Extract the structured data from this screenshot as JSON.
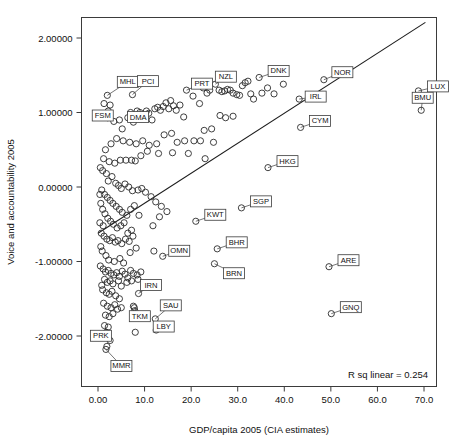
{
  "figure": {
    "background": "#ffffff",
    "frame_color": "#3b3b3b",
    "marker_color": "#2b2b2b",
    "line_color": "#1c1c1c",
    "annotation_text": "R sq linear = 0.254"
  },
  "chart_data": {
    "type": "scatter",
    "title": "",
    "xlabel": "GDP/capita 2005 (CIA estimates)",
    "ylabel": "Voice and accountability 2005",
    "xlim": [
      -3.5,
      75.5
    ],
    "ylim": [
      -2.6,
      2.45
    ],
    "xticks": [
      0,
      10,
      20,
      30,
      40,
      50,
      60,
      70
    ],
    "xticklabels": [
      "0.00",
      "10.0",
      "20.0",
      "30.0",
      "40.0",
      "50.0",
      "60.0",
      "70.0"
    ],
    "yticks": [
      2,
      1,
      0,
      -1,
      -2
    ],
    "yticklabels": [
      "2.00000",
      "1.00000",
      "0.00000",
      "-1.00000",
      "-2.00000"
    ],
    "grid": false,
    "legend": null,
    "annotations": [
      {
        "text": "R sq linear = 0.254",
        "position": "bottom-right"
      }
    ],
    "fit_line": {
      "type": "linear",
      "r_squared": 0.254,
      "x_start": 0.0,
      "y_start": -0.62,
      "x_end": 70.3,
      "y_end": 2.21
    },
    "labeled_points": [
      {
        "label": "MHL",
        "x": 2.0,
        "y": 1.23,
        "box_dx": 10,
        "box_dy": -19
      },
      {
        "label": "PCI",
        "x": 7.4,
        "y": 1.24,
        "box_dx": 5,
        "box_dy": -19
      },
      {
        "label": "FSM",
        "x": 2.2,
        "y": 1.02,
        "box_dx": -16,
        "box_dy": -1
      },
      {
        "label": "DMA",
        "x": 7.0,
        "y": 1.0,
        "box_dx": -3,
        "box_dy": -1
      },
      {
        "label": "PRT",
        "x": 19.0,
        "y": 1.3,
        "box_dx": 5,
        "box_dy": -12
      },
      {
        "label": "NZL",
        "x": 25.2,
        "y": 1.38,
        "box_dx": 0,
        "box_dy": -13
      },
      {
        "label": "DNK",
        "x": 34.6,
        "y": 1.47,
        "box_dx": 9,
        "box_dy": -12
      },
      {
        "label": "NOR",
        "x": 48.5,
        "y": 1.44,
        "box_dx": 8,
        "box_dy": -13
      },
      {
        "label": "IRL",
        "x": 43.2,
        "y": 1.18,
        "box_dx": 6,
        "box_dy": -8
      },
      {
        "label": "LUX",
        "x": 68.8,
        "y": 1.29,
        "box_dx": 9,
        "box_dy": -10
      },
      {
        "label": "BMU",
        "x": 69.4,
        "y": 1.03,
        "box_dx": -9,
        "box_dy": -18
      },
      {
        "label": "CYM",
        "x": 43.5,
        "y": 0.8,
        "box_dx": 9,
        "box_dy": -12
      },
      {
        "label": "HKG",
        "x": 36.5,
        "y": 0.26,
        "box_dx": 9,
        "box_dy": -12
      },
      {
        "label": "SGP",
        "x": 30.8,
        "y": -0.28,
        "box_dx": 9,
        "box_dy": -12
      },
      {
        "label": "KWT",
        "x": 21.0,
        "y": -0.46,
        "box_dx": 9,
        "box_dy": -12
      },
      {
        "label": "BHR",
        "x": 25.6,
        "y": -0.83,
        "box_dx": 9,
        "box_dy": -12
      },
      {
        "label": "BRN",
        "x": 25.0,
        "y": -1.03,
        "box_dx": 9,
        "box_dy": 4
      },
      {
        "label": "ARE",
        "x": 49.6,
        "y": -1.07,
        "box_dx": 9,
        "box_dy": -12
      },
      {
        "label": "GNQ",
        "x": 50.1,
        "y": -1.7,
        "box_dx": 9,
        "box_dy": -12
      },
      {
        "label": "OMN",
        "x": 13.9,
        "y": -0.93,
        "box_dx": 6,
        "box_dy": -11
      },
      {
        "label": "IRN",
        "x": 8.7,
        "y": -1.43,
        "box_dx": 2,
        "box_dy": -14
      },
      {
        "label": "SAU",
        "x": 12.3,
        "y": -1.77,
        "box_dx": 5,
        "box_dy": -19
      },
      {
        "label": "TKM",
        "x": 7.8,
        "y": -1.62,
        "box_dx": -5,
        "box_dy": 3
      },
      {
        "label": "LBY",
        "x": 12.5,
        "y": -1.92,
        "box_dx": -3,
        "box_dy": -9
      },
      {
        "label": "PRK",
        "x": 1.8,
        "y": -1.95,
        "box_dx": -16,
        "box_dy": -2
      },
      {
        "label": "MMR",
        "x": 1.7,
        "y": -2.18,
        "box_dx": 5,
        "box_dy": 11
      }
    ],
    "points": [
      [
        2.0,
        1.23
      ],
      [
        7.4,
        1.24
      ],
      [
        2.2,
        1.02
      ],
      [
        7.0,
        1.0
      ],
      [
        19.0,
        1.3
      ],
      [
        25.2,
        1.38
      ],
      [
        34.6,
        1.47
      ],
      [
        48.5,
        1.44
      ],
      [
        43.2,
        1.18
      ],
      [
        68.8,
        1.29
      ],
      [
        69.4,
        1.03
      ],
      [
        43.5,
        0.8
      ],
      [
        36.5,
        0.26
      ],
      [
        30.8,
        -0.28
      ],
      [
        21.0,
        -0.46
      ],
      [
        25.6,
        -0.83
      ],
      [
        25.0,
        -1.03
      ],
      [
        49.6,
        -1.07
      ],
      [
        50.1,
        -1.7
      ],
      [
        13.9,
        -0.93
      ],
      [
        8.7,
        -1.43
      ],
      [
        12.3,
        -1.77
      ],
      [
        7.8,
        -1.62
      ],
      [
        12.5,
        -1.92
      ],
      [
        1.8,
        -1.95
      ],
      [
        1.7,
        -2.18
      ],
      [
        1.3,
        1.12
      ],
      [
        2.6,
        1.1
      ],
      [
        2.1,
        0.93
      ],
      [
        3.4,
        0.88
      ],
      [
        4.6,
        0.9
      ],
      [
        5.2,
        0.78
      ],
      [
        6.4,
        0.93
      ],
      [
        7.6,
        0.87
      ],
      [
        8.4,
        1.02
      ],
      [
        9.0,
        1.0
      ],
      [
        9.8,
        0.96
      ],
      [
        10.4,
        1.02
      ],
      [
        10.9,
        0.99
      ],
      [
        11.6,
        0.9
      ],
      [
        12.2,
        1.05
      ],
      [
        12.8,
        1.07
      ],
      [
        13.4,
        1.03
      ],
      [
        14.0,
        1.08
      ],
      [
        14.6,
        1.13
      ],
      [
        15.2,
        1.05
      ],
      [
        15.6,
        1.16
      ],
      [
        16.2,
        1.09
      ],
      [
        16.8,
        1.03
      ],
      [
        17.6,
        1.1
      ],
      [
        18.4,
        0.94
      ],
      [
        20.4,
        1.22
      ],
      [
        21.8,
        1.12
      ],
      [
        22.6,
        1.33
      ],
      [
        23.4,
        1.26
      ],
      [
        24.0,
        1.3
      ],
      [
        26.0,
        1.3
      ],
      [
        26.6,
        1.28
      ],
      [
        27.2,
        1.29
      ],
      [
        27.8,
        1.31
      ],
      [
        28.4,
        1.3
      ],
      [
        29.0,
        1.26
      ],
      [
        29.8,
        1.24
      ],
      [
        30.4,
        1.23
      ],
      [
        31.0,
        1.36
      ],
      [
        31.6,
        1.4
      ],
      [
        32.2,
        1.42
      ],
      [
        32.8,
        1.25
      ],
      [
        33.4,
        1.18
      ],
      [
        35.2,
        1.26
      ],
      [
        36.4,
        1.33
      ],
      [
        37.8,
        1.25
      ],
      [
        39.8,
        1.38
      ],
      [
        27.4,
        0.93
      ],
      [
        29.0,
        0.95
      ],
      [
        26.2,
        0.96
      ],
      [
        24.4,
        0.78
      ],
      [
        22.0,
        0.62
      ],
      [
        20.6,
        0.62
      ],
      [
        18.6,
        0.62
      ],
      [
        17.0,
        0.6
      ],
      [
        15.8,
        0.72
      ],
      [
        14.2,
        0.7
      ],
      [
        12.6,
        0.58
      ],
      [
        11.0,
        0.56
      ],
      [
        9.6,
        0.62
      ],
      [
        8.2,
        0.58
      ],
      [
        6.8,
        0.6
      ],
      [
        5.4,
        0.62
      ],
      [
        4.0,
        0.65
      ],
      [
        2.8,
        0.58
      ],
      [
        1.6,
        0.5
      ],
      [
        1.2,
        0.38
      ],
      [
        2.4,
        0.34
      ],
      [
        3.6,
        0.32
      ],
      [
        4.8,
        0.36
      ],
      [
        6.0,
        0.36
      ],
      [
        7.2,
        0.36
      ],
      [
        8.0,
        0.35
      ],
      [
        9.2,
        0.42
      ],
      [
        10.6,
        0.48
      ],
      [
        13.0,
        0.45
      ],
      [
        16.0,
        0.46
      ],
      [
        19.4,
        0.45
      ],
      [
        23.0,
        0.38
      ],
      [
        24.8,
        0.6
      ],
      [
        22.8,
        0.76
      ],
      [
        1.0,
        0.22
      ],
      [
        1.8,
        0.18
      ],
      [
        2.2,
        0.08
      ],
      [
        3.0,
        0.14
      ],
      [
        3.8,
        0.05
      ],
      [
        4.4,
        0.02
      ],
      [
        5.0,
        -0.02
      ],
      [
        5.8,
        0.04
      ],
      [
        6.6,
        0.0
      ],
      [
        7.4,
        -0.05
      ],
      [
        8.6,
        -0.04
      ],
      [
        9.4,
        -0.02
      ],
      [
        10.2,
        -0.07
      ],
      [
        11.4,
        -0.13
      ],
      [
        12.4,
        -0.2
      ],
      [
        13.6,
        -0.26
      ],
      [
        14.8,
        -0.33
      ],
      [
        0.8,
        -0.04
      ],
      [
        1.4,
        -0.1
      ],
      [
        2.0,
        -0.14
      ],
      [
        2.6,
        -0.18
      ],
      [
        3.2,
        -0.22
      ],
      [
        3.9,
        -0.26
      ],
      [
        4.6,
        -0.3
      ],
      [
        5.2,
        -0.34
      ],
      [
        6.2,
        -0.38
      ],
      [
        7.0,
        -0.3
      ],
      [
        7.8,
        -0.25
      ],
      [
        8.8,
        -0.38
      ],
      [
        0.6,
        -0.22
      ],
      [
        1.0,
        -0.3
      ],
      [
        1.5,
        -0.36
      ],
      [
        2.1,
        -0.42
      ],
      [
        2.7,
        -0.46
      ],
      [
        3.3,
        -0.5
      ],
      [
        4.1,
        -0.55
      ],
      [
        4.9,
        -0.52
      ],
      [
        5.6,
        -0.48
      ],
      [
        6.4,
        -0.62
      ],
      [
        7.2,
        -0.58
      ],
      [
        13.2,
        -0.4
      ],
      [
        11.8,
        -0.52
      ],
      [
        0.7,
        -0.62
      ],
      [
        1.3,
        -0.66
      ],
      [
        1.9,
        -0.7
      ],
      [
        2.5,
        -0.72
      ],
      [
        3.1,
        -0.68
      ],
      [
        3.7,
        -0.74
      ],
      [
        4.3,
        -0.72
      ],
      [
        5.1,
        -0.76
      ],
      [
        5.9,
        -0.7
      ],
      [
        6.7,
        -0.73
      ],
      [
        7.5,
        -0.66
      ],
      [
        0.9,
        -0.86
      ],
      [
        1.7,
        -0.92
      ],
      [
        2.3,
        -0.98
      ],
      [
        3.5,
        -1.0
      ],
      [
        4.7,
        -0.96
      ],
      [
        5.5,
        -1.02
      ],
      [
        6.9,
        -0.88
      ],
      [
        8.2,
        -0.82
      ],
      [
        12.0,
        -0.86
      ],
      [
        0.5,
        -1.06
      ],
      [
        1.1,
        -1.1
      ],
      [
        1.6,
        -1.14
      ],
      [
        2.2,
        -1.12
      ],
      [
        2.8,
        -1.16
      ],
      [
        3.4,
        -1.18
      ],
      [
        4.0,
        -1.15
      ],
      [
        4.6,
        -1.2
      ],
      [
        5.2,
        -1.13
      ],
      [
        5.8,
        -1.17
      ],
      [
        6.4,
        -1.22
      ],
      [
        7.0,
        -1.12
      ],
      [
        7.6,
        -1.16
      ],
      [
        8.4,
        -1.18
      ],
      [
        9.2,
        -1.14
      ],
      [
        1.4,
        -1.24
      ],
      [
        2.0,
        -1.28
      ],
      [
        2.6,
        -1.26
      ],
      [
        3.2,
        -1.3
      ],
      [
        4.4,
        -1.26
      ],
      [
        5.0,
        -1.33
      ],
      [
        6.2,
        -1.28
      ],
      [
        7.2,
        -1.26
      ],
      [
        8.6,
        -1.24
      ],
      [
        1.0,
        -1.38
      ],
      [
        1.8,
        -1.42
      ],
      [
        2.4,
        -1.44
      ],
      [
        3.0,
        -1.4
      ],
      [
        3.8,
        -1.46
      ],
      [
        4.6,
        -1.5
      ],
      [
        1.2,
        -1.56
      ],
      [
        2.0,
        -1.6
      ],
      [
        2.8,
        -1.62
      ],
      [
        3.6,
        -1.58
      ],
      [
        4.2,
        -1.64
      ],
      [
        5.0,
        -1.62
      ],
      [
        1.6,
        -1.72
      ],
      [
        2.4,
        -1.74
      ],
      [
        3.2,
        -1.7
      ],
      [
        7.6,
        -1.6
      ],
      [
        7.9,
        -1.66
      ],
      [
        1.4,
        -1.86
      ],
      [
        2.2,
        -1.88
      ],
      [
        8.0,
        -1.95
      ],
      [
        2.6,
        -2.06
      ],
      [
        1.9,
        -2.14
      ],
      [
        0.4,
        -0.48
      ],
      [
        0.4,
        -0.1
      ],
      [
        0.5,
        0.26
      ],
      [
        1.1,
        -0.52
      ],
      [
        0.6,
        -0.8
      ],
      [
        0.8,
        -1.32
      ]
    ]
  }
}
